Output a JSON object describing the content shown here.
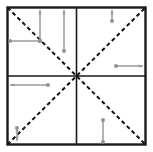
{
  "figure": {
    "canvas": {
      "width": 153,
      "height": 152
    },
    "background_color": "#ffffff"
  },
  "frame": {
    "name": "outer-square",
    "x": 7.5,
    "y": 7.5,
    "width": 138,
    "height": 137,
    "stroke": "#1a1a1a",
    "stroke_width": 2.4,
    "fill": "none"
  },
  "center": {
    "x": 76.5,
    "y": 76
  },
  "axes": [
    {
      "name": "vertical-center-line",
      "orientation": "vertical",
      "x1": 76.5,
      "y1": 7.5,
      "x2": 76.5,
      "y2": 144.5,
      "stroke": "#1a1a1a",
      "stroke_width": 1.6
    },
    {
      "name": "horizontal-center-line",
      "orientation": "horizontal",
      "x1": 7.5,
      "y1": 76,
      "x2": 145.5,
      "y2": 76,
      "stroke": "#1a1a1a",
      "stroke_width": 1.6
    }
  ],
  "diagonals": [
    {
      "name": "diagonal-top-left-to-bottom-right",
      "x1": 7.5,
      "y1": 7.5,
      "x2": 145.5,
      "y2": 144.5,
      "stroke": "#111111",
      "stroke_width": 2.0,
      "dash": "4 3"
    },
    {
      "name": "diagonal-bottom-left-to-top-right",
      "x1": 7.5,
      "y1": 144.5,
      "x2": 145.5,
      "y2": 7.5,
      "stroke": "#111111",
      "stroke_width": 2.0,
      "dash": "4 3"
    }
  ],
  "arrow_style": {
    "stroke": "#9a9a9a",
    "stroke_width": 1.5,
    "endpoint_color": "#8e8e8e",
    "endpoint_size": 3.4,
    "head_length": 4.5,
    "head_width": 3.2
  },
  "measurement_arrows": [
    {
      "name": "arrow-q2-vertical-inner",
      "quadrant": "top-left",
      "orientation": "vertical",
      "x1": 40,
      "y1": 41,
      "x2": 40,
      "y2": 10,
      "head_at": "end",
      "tail_marker": "square"
    },
    {
      "name": "arrow-q2-horizontal",
      "quadrant": "top-left",
      "orientation": "horizontal",
      "x1": 40,
      "y1": 41,
      "x2": 10,
      "y2": 41,
      "head_at": "none",
      "tail_marker": "square"
    },
    {
      "name": "arrow-q2-vertical-outer",
      "quadrant": "top-left",
      "orientation": "vertical",
      "x1": 64,
      "y1": 51,
      "x2": 64,
      "y2": 10,
      "head_at": "end",
      "tail_marker": "square"
    },
    {
      "name": "arrow-q1-vertical-short",
      "quadrant": "top-right",
      "orientation": "vertical",
      "x1": 112,
      "y1": 21,
      "x2": 112,
      "y2": 10,
      "head_at": "end",
      "tail_marker": "square"
    },
    {
      "name": "arrow-q1-horizontal-right",
      "quadrant": "right-middle",
      "orientation": "horizontal",
      "x1": 116,
      "y1": 66,
      "x2": 143,
      "y2": 66,
      "head_at": "end",
      "tail_marker": "square"
    },
    {
      "name": "arrow-q3-horizontal-left",
      "quadrant": "bottom-left",
      "orientation": "horizontal",
      "x1": 48,
      "y1": 85,
      "x2": 10,
      "y2": 85,
      "head_at": "end",
      "tail_marker": "square"
    },
    {
      "name": "arrow-q3-corner-vertical",
      "quadrant": "bottom-left-corner",
      "orientation": "vertical",
      "x1": 17,
      "y1": 128,
      "x2": 17,
      "y2": 141,
      "head_at": "both",
      "tail_marker": "square"
    },
    {
      "name": "arrow-q4-vertical",
      "quadrant": "bottom-right",
      "orientation": "vertical",
      "x1": 103,
      "y1": 120,
      "x2": 103,
      "y2": 142,
      "head_at": "none",
      "tail_marker": "square"
    }
  ]
}
